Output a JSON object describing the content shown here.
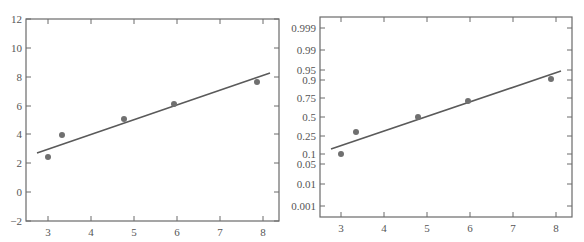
{
  "chart_data": [
    {
      "type": "scatter",
      "title": "",
      "xlabel": "",
      "ylabel": "",
      "xlim": [
        2.6,
        8.4
      ],
      "ylim": [
        -2,
        12
      ],
      "grid": false,
      "x_ticks": [
        "3",
        "4",
        "5",
        "6",
        "7",
        "8"
      ],
      "y_ticks": [
        "-2",
        "0",
        "2",
        "4",
        "6",
        "8",
        "10",
        "12"
      ],
      "series": [
        {
          "name": "data points",
          "x": [
            3.0,
            3.35,
            4.8,
            5.95,
            7.9
          ],
          "y": [
            2.4,
            4.0,
            5.1,
            6.15,
            7.7
          ]
        },
        {
          "name": "fitted line",
          "kind": "line",
          "x": [
            2.75,
            8.1
          ],
          "y": [
            2.75,
            8.2
          ]
        }
      ]
    },
    {
      "type": "scatter",
      "title": "",
      "xlabel": "",
      "ylabel": "",
      "xlim": [
        2.6,
        8.4
      ],
      "yscale": "probability (normal)",
      "grid": false,
      "x_ticks": [
        "3",
        "4",
        "5",
        "6",
        "7",
        "8"
      ],
      "y_ticks": [
        "0.001",
        "0.01",
        "0.05",
        "0.1",
        "0.25",
        "0.5",
        "0.75",
        "0.9",
        "0.95",
        "0.99",
        "0.999"
      ],
      "series": [
        {
          "name": "data points",
          "x": [
            3.0,
            3.35,
            4.8,
            5.95,
            7.9
          ],
          "y": [
            0.1,
            0.3,
            0.5,
            0.7,
            0.9
          ]
        },
        {
          "name": "fitted line",
          "kind": "line",
          "x": [
            2.75,
            8.1
          ],
          "y": [
            0.15,
            0.94
          ]
        }
      ]
    }
  ],
  "left": {
    "x_ticks": [
      {
        "label": "3",
        "px": 48
      },
      {
        "label": "4",
        "px": 91
      },
      {
        "label": "5",
        "px": 134
      },
      {
        "label": "6",
        "px": 177
      },
      {
        "label": "7",
        "px": 220
      },
      {
        "label": "8",
        "px": 263
      }
    ],
    "y_ticks": [
      {
        "label": "12",
        "py": 19
      },
      {
        "label": "10",
        "py": 48
      },
      {
        "label": "8",
        "py": 77
      },
      {
        "label": "6",
        "py": 106
      },
      {
        "label": "4",
        "py": 134
      },
      {
        "label": "2",
        "py": 163
      },
      {
        "label": "0",
        "py": 192
      },
      {
        "label": "−2",
        "py": 221
      }
    ]
  },
  "right": {
    "x_ticks": [
      {
        "label": "3",
        "px": 341
      },
      {
        "label": "4",
        "px": 384
      },
      {
        "label": "5",
        "px": 427
      },
      {
        "label": "6",
        "px": 470
      },
      {
        "label": "7",
        "px": 513
      },
      {
        "label": "8",
        "px": 556
      }
    ],
    "y_ticks": [
      {
        "label": "0.999",
        "py": 28
      },
      {
        "label": "0.99",
        "py": 50
      },
      {
        "label": "0.95",
        "py": 70
      },
      {
        "label": "0.9",
        "py": 80
      },
      {
        "label": "0.75",
        "py": 98
      },
      {
        "label": "0.5",
        "py": 117
      },
      {
        "label": "0.25",
        "py": 136
      },
      {
        "label": "0.1",
        "py": 154
      },
      {
        "label": "0.05",
        "py": 164
      },
      {
        "label": "0.01",
        "py": 184
      },
      {
        "label": "0.001",
        "py": 206
      }
    ]
  }
}
